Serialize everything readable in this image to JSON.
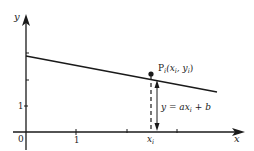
{
  "diagram": {
    "axes": {
      "x_label": "x",
      "y_label": "y",
      "origin_label": "0",
      "x_tick_label": "1",
      "y_tick_label": "1"
    },
    "point": {
      "name": "P",
      "subscript": "i",
      "coords_label": "(x",
      "coords_sub1": "i",
      "coords_mid": ", y",
      "coords_sub2": "i",
      "coords_end": ")"
    },
    "xi_label": "x",
    "xi_sub": "i",
    "equation": {
      "prefix": "y = ax",
      "sub": "i",
      "suffix": " + b"
    },
    "colors": {
      "ink": "#1a1a1a",
      "background": "#ffffff"
    }
  }
}
